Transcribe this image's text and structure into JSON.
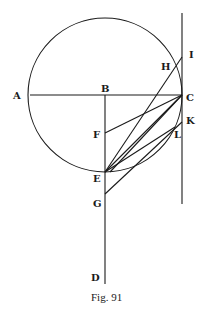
{
  "figure": {
    "caption": "Fig. 91",
    "stroke_color": "#1a1a1a",
    "labels": {
      "A": "A",
      "B": "B",
      "C": "C",
      "D": "D",
      "E": "E",
      "F": "F",
      "G": "G",
      "H": "H",
      "I": "I",
      "K": "K",
      "L": "L"
    },
    "points": {
      "A": [
        30,
        95
      ],
      "B": [
        105,
        95
      ],
      "C": [
        182,
        95
      ],
      "D": [
        105,
        283
      ],
      "E": [
        105,
        172
      ],
      "F": [
        105,
        133
      ],
      "G": [
        105,
        194
      ],
      "H": [
        175,
        68
      ],
      "I": [
        182,
        57
      ],
      "K": [
        182,
        122
      ],
      "L": [
        175,
        127
      ]
    },
    "circle": {
      "center": "B",
      "radius": 77
    },
    "segments": [
      [
        "A",
        "C"
      ],
      [
        "B",
        "D"
      ],
      [
        "C_top",
        "C_bottom"
      ],
      [
        "E",
        "I"
      ],
      [
        "E",
        "C"
      ],
      [
        "F",
        "C"
      ],
      [
        "E",
        "L"
      ],
      [
        "G",
        "K"
      ]
    ]
  }
}
